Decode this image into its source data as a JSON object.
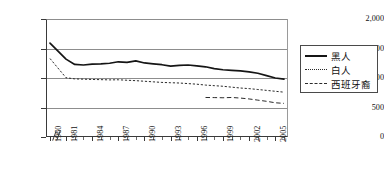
{
  "chart_data": {
    "type": "line",
    "title": "",
    "subtitle": "",
    "xlabel": "",
    "ylabel": "",
    "ylim": [
      0,
      2000
    ],
    "grid": true,
    "legend_position": "right",
    "axis_break_after_first_tick": true,
    "y_ticks": [
      "0",
      "500",
      "1,000",
      "1,500",
      "2,000"
    ],
    "y_tick_values": [
      0,
      500,
      1000,
      1500,
      2000
    ],
    "x_tick_labels": [
      "1960",
      "1981",
      "1984",
      "1987",
      "1990",
      "1993",
      "1996",
      "1999",
      "2002",
      "2005"
    ],
    "x_labeled_years": [
      1960,
      1981,
      1984,
      1987,
      1990,
      1993,
      1996,
      1999,
      2002,
      2005
    ],
    "x_all_years": [
      1960,
      1981,
      1982,
      1983,
      1984,
      1985,
      1986,
      1987,
      1988,
      1989,
      1990,
      1991,
      1992,
      1993,
      1994,
      1995,
      1996,
      1997,
      1998,
      1999,
      2000,
      2001,
      2002,
      2003,
      2004,
      2005,
      2006
    ],
    "series": [
      {
        "name": "黑人",
        "style": "solid",
        "x": [
          1960,
          1981,
          1982,
          1983,
          1984,
          1985,
          1986,
          1987,
          1988,
          1989,
          1990,
          1991,
          1992,
          1993,
          1994,
          1995,
          1996,
          1997,
          1998,
          1999,
          2000,
          2001,
          2002,
          2003,
          2004,
          2005,
          2006
        ],
        "values": [
          1590,
          1320,
          1230,
          1220,
          1235,
          1240,
          1250,
          1275,
          1265,
          1290,
          1255,
          1240,
          1225,
          1200,
          1215,
          1220,
          1205,
          1190,
          1160,
          1140,
          1130,
          1120,
          1105,
          1080,
          1040,
          1000,
          980
        ]
      },
      {
        "name": "白人",
        "style": "dotted",
        "x": [
          1960,
          1981,
          1982,
          1983,
          1984,
          1985,
          1986,
          1987,
          1988,
          1989,
          1990,
          1991,
          1992,
          1993,
          1994,
          1995,
          1996,
          1997,
          1998,
          1999,
          2000,
          2001,
          2002,
          2003,
          2004,
          2005,
          2006
        ],
        "values": [
          1330,
          1005,
          985,
          980,
          975,
          972,
          968,
          970,
          962,
          955,
          945,
          935,
          925,
          920,
          915,
          905,
          895,
          880,
          870,
          860,
          845,
          830,
          820,
          805,
          790,
          775,
          760
        ]
      },
      {
        "name": "西班牙裔",
        "style": "dashed",
        "x": [
          1997,
          1998,
          1999,
          2000,
          2001,
          2002,
          2003,
          2004,
          2005,
          2006
        ],
        "values": [
          670,
          668,
          665,
          670,
          660,
          645,
          625,
          605,
          580,
          570
        ]
      }
    ]
  },
  "legend": {
    "items": [
      {
        "label": "黑人",
        "style": "solid"
      },
      {
        "label": "白人",
        "style": "dotted"
      },
      {
        "label": "西班牙裔",
        "style": "dashed"
      }
    ]
  }
}
